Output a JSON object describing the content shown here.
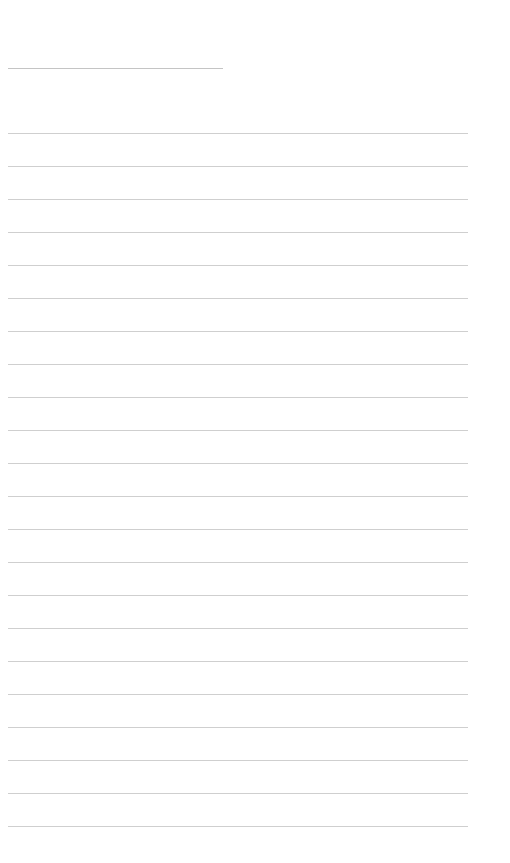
{
  "document": {
    "title_text": "",
    "title_line": {
      "x": 8,
      "y": 68,
      "width": 215,
      "color": "#c4c4c4"
    },
    "ruled_lines": {
      "count": 22,
      "start_y": 133,
      "spacing": 33,
      "x": 8,
      "width": 460,
      "color": "#cfcfcf"
    },
    "lines": [
      "",
      "",
      "",
      "",
      "",
      "",
      "",
      "",
      "",
      "",
      "",
      "",
      "",
      "",
      "",
      "",
      "",
      "",
      "",
      "",
      "",
      ""
    ]
  }
}
